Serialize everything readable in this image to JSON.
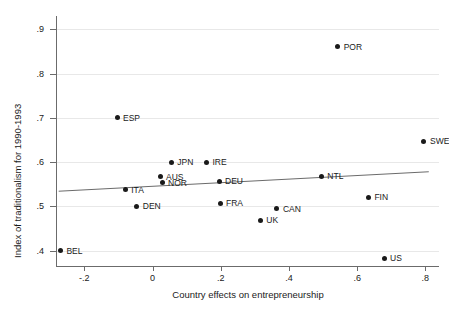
{
  "chart_data": {
    "type": "scatter",
    "title": "",
    "xlabel": "Country effects on entrepreneurship",
    "ylabel": "Index of traditionalism for 1990-1993",
    "xlim": [
      -0.28,
      0.84
    ],
    "ylim": [
      0.365,
      0.93
    ],
    "xticks": [
      -0.2,
      0,
      0.2,
      0.4,
      0.6,
      0.8
    ],
    "xticklabels": [
      "-.2",
      "0",
      ".2",
      ".4",
      ".6",
      ".8"
    ],
    "yticks": [
      0.4,
      0.5,
      0.6,
      0.7,
      0.8,
      0.9
    ],
    "yticklabels": [
      ".4",
      ".5",
      ".6",
      ".7",
      ".8",
      ".9"
    ],
    "grid": "horizontal",
    "legend": "none",
    "marker_color": "#1a1a1a",
    "line_color": "#6b6b6b",
    "points": [
      {
        "label": "BEL",
        "x": -0.27,
        "y": 0.4,
        "lx": 6,
        "ly": 0
      },
      {
        "label": "ESP",
        "x": -0.104,
        "y": 0.7,
        "lx": 6,
        "ly": 0
      },
      {
        "label": "ITA",
        "x": -0.08,
        "y": 0.537,
        "lx": 6,
        "ly": 0
      },
      {
        "label": "DEN",
        "x": -0.046,
        "y": 0.5,
        "lx": 6,
        "ly": 0
      },
      {
        "label": "AUS",
        "x": 0.022,
        "y": 0.567,
        "lx": 6,
        "ly": 0
      },
      {
        "label": "NOR",
        "x": 0.028,
        "y": 0.553,
        "lx": 6,
        "ly": 0
      },
      {
        "label": "JPN",
        "x": 0.055,
        "y": 0.6,
        "lx": 6,
        "ly": 0
      },
      {
        "label": "IRE",
        "x": 0.158,
        "y": 0.6,
        "lx": 6,
        "ly": 0
      },
      {
        "label": "DEU",
        "x": 0.195,
        "y": 0.556,
        "lx": 6,
        "ly": 0
      },
      {
        "label": "FRA",
        "x": 0.198,
        "y": 0.507,
        "lx": 6,
        "ly": 0
      },
      {
        "label": "UK",
        "x": 0.316,
        "y": 0.468,
        "lx": 6,
        "ly": 0
      },
      {
        "label": "CAN",
        "x": 0.365,
        "y": 0.494,
        "lx": 6,
        "ly": 0
      },
      {
        "label": "NTL",
        "x": 0.495,
        "y": 0.568,
        "lx": 6,
        "ly": 0
      },
      {
        "label": "POR",
        "x": 0.543,
        "y": 0.86,
        "lx": 6,
        "ly": 0
      },
      {
        "label": "FIN",
        "x": 0.633,
        "y": 0.52,
        "lx": 6,
        "ly": 0
      },
      {
        "label": "US",
        "x": 0.679,
        "y": 0.382,
        "lx": 6,
        "ly": 0
      },
      {
        "label": "SWE",
        "x": 0.796,
        "y": 0.647,
        "lx": 6,
        "ly": 0
      }
    ],
    "fit_line": {
      "x_start": -0.275,
      "y_start": 0.534,
      "x_end": 0.81,
      "y_end": 0.578
    }
  }
}
